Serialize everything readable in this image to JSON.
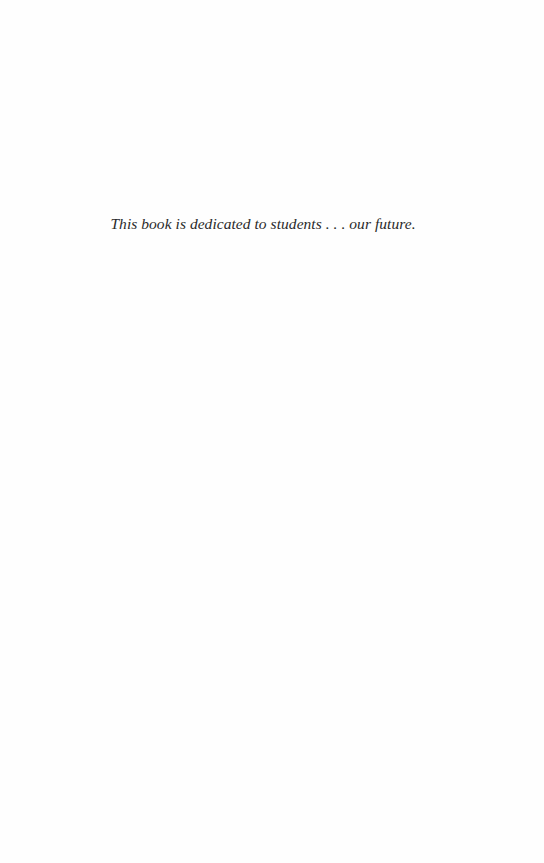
{
  "page": {
    "background_color": "#fefefe",
    "text_color": "#2a2a2a"
  },
  "dedication": {
    "text": "This book is dedicated to students . . . our future."
  }
}
